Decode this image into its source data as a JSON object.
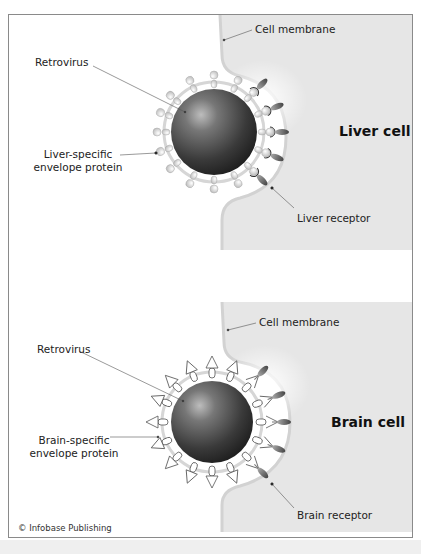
{
  "panels": [
    {
      "id": "liver",
      "cell_label": "Liver cell",
      "membrane_label": "Cell membrane",
      "virus_label": "Retrovirus",
      "protein_label_line1": "Liver-specific",
      "protein_label_line2": "envelope protein",
      "receptor_label": "Liver receptor",
      "protein_shape": "ball-knob"
    },
    {
      "id": "brain",
      "cell_label": "Brain cell",
      "membrane_label": "Cell membrane",
      "virus_label": "Retrovirus",
      "protein_label_line1": "Brain-specific",
      "protein_label_line2": "envelope protein",
      "receptor_label": "Brain receptor",
      "protein_shape": "arrowhead"
    }
  ],
  "credit": "© Infobase Publishing",
  "colors": {
    "cell_fill": "#e6e6e6",
    "membrane": "#c8c8c8",
    "virus_dark": "#2a2a2a",
    "virus_light": "#8a8a8a",
    "frame": "#8a8a8a"
  }
}
